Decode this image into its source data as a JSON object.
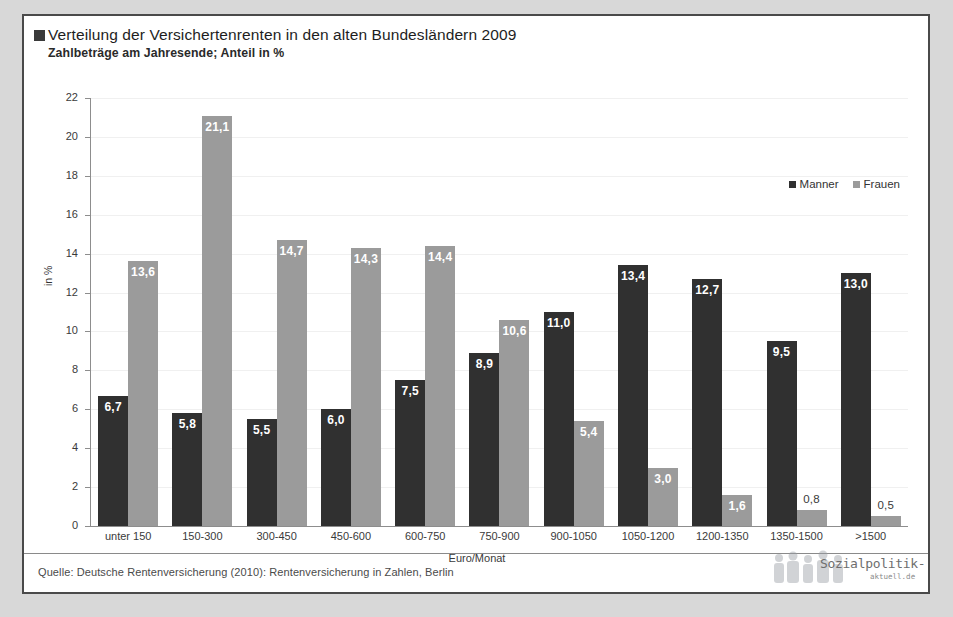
{
  "header": {
    "title": "Verteilung der Versichertenrenten in den alten Bundesländern 2009",
    "subtitle": "Zahlbeträge am Jahresende; Anteil in %"
  },
  "legend": {
    "items": [
      {
        "label": "Manner",
        "color": "#303030"
      },
      {
        "label": "Frauen",
        "color": "#9b9b9b"
      }
    ]
  },
  "footer": {
    "source": "Quelle: Deutsche Rentenversicherung (2010): Rentenversicherung in Zahlen, Berlin",
    "logo_brand": "Sozialpolitik-",
    "logo_sub": "aktuell.de"
  },
  "axis": {
    "ylabel": "in %",
    "xlabel": "Euro/Monat",
    "yticks": [
      "22",
      "20",
      "18",
      "16",
      "14",
      "12",
      "10",
      "8",
      "6",
      "4",
      "2",
      "0"
    ]
  },
  "chart_data": {
    "type": "bar",
    "title": "Verteilung der Versichertenrenten in den alten Bundesländern 2009",
    "subtitle": "Zahlbeträge am Jahresende; Anteil in %",
    "xlabel": "Euro/Monat",
    "ylabel": "in %",
    "ylim": [
      0,
      22
    ],
    "ytick_step": 2,
    "grid": true,
    "legend_position": "top-right",
    "categories": [
      "unter 150",
      "150-300",
      "300-450",
      "450-600",
      "600-750",
      "750-900",
      "900-1050",
      "1050-1200",
      "1200-1350",
      "1350-1500",
      ">1500"
    ],
    "series": [
      {
        "name": "Manner",
        "color": "#303030",
        "values": [
          6.7,
          5.8,
          5.5,
          6.0,
          7.5,
          8.9,
          11.0,
          13.4,
          12.7,
          9.5,
          13.0
        ],
        "labels": [
          "6,7",
          "5,8",
          "5,5",
          "6,0",
          "7,5",
          "8,9",
          "11,0",
          "13,4",
          "12,7",
          "9,5",
          "13,0"
        ]
      },
      {
        "name": "Frauen",
        "color": "#9b9b9b",
        "values": [
          13.6,
          21.1,
          14.7,
          14.3,
          14.4,
          10.6,
          5.4,
          3.0,
          1.6,
          0.8,
          0.5
        ],
        "labels": [
          "13,6",
          "21,1",
          "14,7",
          "14,3",
          "14,4",
          "10,6",
          "5,4",
          "3,0",
          "1,6",
          "0,8",
          "0,5"
        ]
      }
    ]
  }
}
